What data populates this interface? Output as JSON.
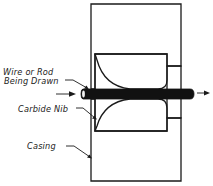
{
  "diagram": {
    "labels": {
      "wire_line1": "Wire or Rod",
      "wire_line2": "Being Drawn",
      "nib": "Carbide Nib",
      "casing": "Casing"
    },
    "components": [
      {
        "id": "casing",
        "label": "Casing",
        "hatch": "coarse diagonal"
      },
      {
        "id": "nib",
        "label": "Carbide Nib",
        "hatch": "fine diagonal"
      },
      {
        "id": "wire",
        "label": "Wire or Rod Being Drawn",
        "fill": "solid black"
      }
    ],
    "flow_direction": "left-to-right",
    "colors": {
      "ink": "#1a1a1a",
      "background": "#ffffff",
      "nib_fill": "#d8d8d8"
    }
  }
}
